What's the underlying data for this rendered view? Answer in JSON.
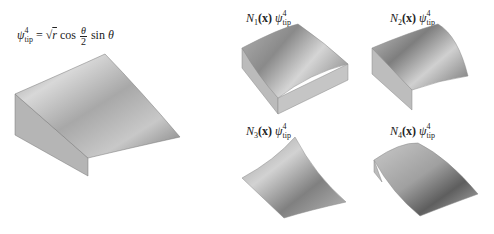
{
  "figure": {
    "main": {
      "formula": {
        "lhs_symbol": "ψ",
        "lhs_superscript": "4",
        "lhs_subscript": "tip",
        "equals": "=",
        "sqrt": "√",
        "r": "r",
        "cos": "cos",
        "frac_num": "θ",
        "frac_den": "2",
        "sin": "sin",
        "theta": "θ"
      }
    },
    "panels": [
      {
        "N": "N",
        "index": "1",
        "arg": "(x)",
        "symbol": "ψ",
        "superscript": "4",
        "subscript": "tip"
      },
      {
        "N": "N",
        "index": "2",
        "arg": "(x)",
        "symbol": "ψ",
        "superscript": "4",
        "subscript": "tip"
      },
      {
        "N": "N",
        "index": "3",
        "arg": "(x)",
        "symbol": "ψ",
        "superscript": "4",
        "subscript": "tip"
      },
      {
        "N": "N",
        "index": "4",
        "arg": "(x)",
        "symbol": "ψ",
        "superscript": "4",
        "subscript": "tip"
      }
    ]
  }
}
